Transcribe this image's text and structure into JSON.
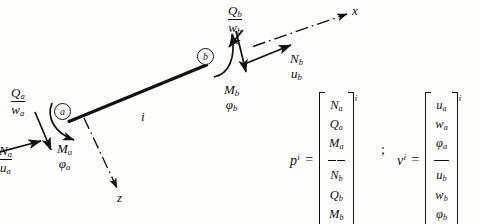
{
  "diagram": {
    "nodes": [
      {
        "name": "node-a",
        "label": "a"
      },
      {
        "name": "node-b",
        "label": "b"
      }
    ],
    "element_label": "i",
    "axes": [
      {
        "name": "x-axis",
        "label": "x"
      },
      {
        "name": "z-axis",
        "label": "z"
      }
    ],
    "end_a": {
      "axial": {
        "force": "N",
        "disp": "u",
        "sub": "a"
      },
      "shear": {
        "force": "Q",
        "disp": "w",
        "sub": "a"
      },
      "moment": {
        "force": "M",
        "disp": "φ",
        "sub": "a"
      }
    },
    "end_b": {
      "axial": {
        "force": "N",
        "disp": "u",
        "sub": "b"
      },
      "shear": {
        "force": "Q",
        "disp": "w",
        "sub": "b"
      },
      "moment": {
        "force": "M",
        "disp": "φ",
        "sub": "b"
      }
    }
  },
  "equations": {
    "separator": ";",
    "force_vector": {
      "lhs": "p",
      "lhs_exponent": "i",
      "equals": "=",
      "exponent": "i",
      "rows_top": [
        "N",
        "Q",
        "M"
      ],
      "rows_top_sub": "a",
      "rows_bottom": [
        "N",
        "Q",
        "M"
      ],
      "rows_bottom_sub": "b"
    },
    "displacement_vector": {
      "lhs": "v",
      "lhs_exponent": "i",
      "equals": "=",
      "exponent": "i",
      "rows_top": [
        "u",
        "w",
        "φ"
      ],
      "rows_top_sub": "a",
      "rows_bottom": [
        "u",
        "w",
        "φ"
      ],
      "rows_bottom_sub": "b"
    }
  },
  "colors": {
    "ink": "#101010",
    "paper": "#fdfdfc"
  }
}
